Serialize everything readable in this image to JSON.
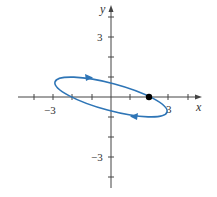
{
  "figure": {
    "type": "parametric-curve-plot",
    "x_axis_label": "x",
    "y_axis_label": "y",
    "tick_labels": {
      "x_neg": "−3",
      "x_pos": "3",
      "y_pos": "3",
      "y_neg": "−3"
    },
    "curve": {
      "shape": "tilted ellipse",
      "color": "#2e75b6",
      "orientation": "clockwise",
      "arrows": [
        "top edge pointing right",
        "bottom edge pointing left"
      ]
    },
    "marked_point": {
      "x": 2,
      "y": 0,
      "color": "#000000"
    },
    "axis_color": "#444444",
    "tick_range": [
      -4,
      4
    ]
  }
}
